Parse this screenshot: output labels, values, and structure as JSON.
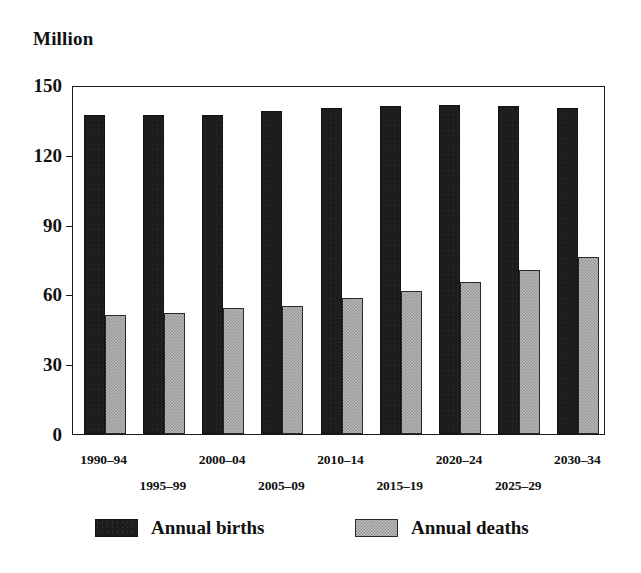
{
  "chart_data": {
    "type": "bar",
    "title": "",
    "subtitle": "",
    "unit_label": "Million",
    "xlabel": "",
    "ylabel": "Million",
    "ylim": [
      0,
      150
    ],
    "yticks": [
      0,
      30,
      60,
      90,
      120,
      150
    ],
    "ytick_labels": [
      "0",
      "30",
      "60",
      "90",
      "120",
      "150"
    ],
    "grid": false,
    "legend_position": "bottom",
    "categories": [
      "1990–94",
      "1995–99",
      "2000–04",
      "2005–09",
      "2010–14",
      "2015–19",
      "2020–24",
      "2025–29",
      "2030–34"
    ],
    "series": [
      {
        "name": "Annual births",
        "color": "#1c1c1c",
        "values": [
          137,
          137,
          137,
          139,
          140,
          141,
          141.5,
          141,
          140
        ]
      },
      {
        "name": "Annual deaths",
        "color": "#b9b9b9",
        "values": [
          51,
          52,
          54,
          55,
          58.5,
          61.5,
          65.5,
          70.5,
          76
        ]
      }
    ]
  },
  "legend": {
    "entries": [
      {
        "label": "Annual births"
      },
      {
        "label": "Annual deaths"
      }
    ]
  },
  "axis": {
    "unit_caption": "Million"
  }
}
